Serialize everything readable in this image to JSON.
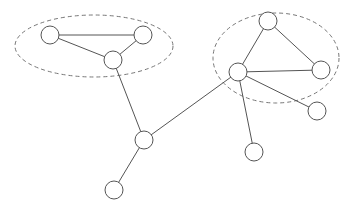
{
  "diagram": {
    "type": "network-graph",
    "width": 348,
    "height": 209,
    "colors": {
      "background": "#ffffff",
      "stroke": "#555555",
      "cluster_stroke": "#777777",
      "node_fill": "#ffffff"
    },
    "node_radius": 9,
    "clusters": [
      {
        "id": "cluster-left",
        "cx": 94,
        "cy": 46,
        "rx": 79,
        "ry": 31,
        "members": [
          "n1",
          "n2",
          "n3"
        ]
      },
      {
        "id": "cluster-right",
        "cx": 276,
        "cy": 58,
        "rx": 63,
        "ry": 45,
        "members": [
          "n6",
          "n7",
          "n8"
        ]
      }
    ],
    "nodes": [
      {
        "id": "n1",
        "x": 50,
        "y": 35
      },
      {
        "id": "n2",
        "x": 143,
        "y": 35
      },
      {
        "id": "n3",
        "x": 113,
        "y": 60
      },
      {
        "id": "n4",
        "x": 144,
        "y": 140
      },
      {
        "id": "n5",
        "x": 114,
        "y": 190
      },
      {
        "id": "n6",
        "x": 268,
        "y": 21
      },
      {
        "id": "n7",
        "x": 238,
        "y": 72
      },
      {
        "id": "n8",
        "x": 321,
        "y": 70
      },
      {
        "id": "n9",
        "x": 317,
        "y": 111
      },
      {
        "id": "n10",
        "x": 254,
        "y": 152
      }
    ],
    "edges": [
      {
        "from": "n1",
        "to": "n2"
      },
      {
        "from": "n1",
        "to": "n3"
      },
      {
        "from": "n2",
        "to": "n3"
      },
      {
        "from": "n3",
        "to": "n4"
      },
      {
        "from": "n4",
        "to": "n5"
      },
      {
        "from": "n4",
        "to": "n7"
      },
      {
        "from": "n6",
        "to": "n7"
      },
      {
        "from": "n6",
        "to": "n8"
      },
      {
        "from": "n7",
        "to": "n8"
      },
      {
        "from": "n7",
        "to": "n9"
      },
      {
        "from": "n7",
        "to": "n10"
      }
    ]
  }
}
